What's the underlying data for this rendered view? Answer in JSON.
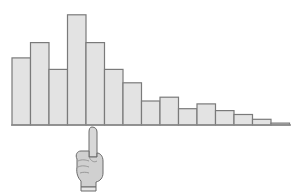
{
  "chart_data": {
    "type": "bar",
    "title": "",
    "xlabel": "",
    "ylabel": "",
    "categories": [
      "1",
      "2",
      "3",
      "4",
      "5",
      "6",
      "7",
      "8",
      "9",
      "10",
      "11",
      "12",
      "13",
      "14",
      "15"
    ],
    "values": [
      70,
      86,
      58,
      115,
      86,
      58,
      44,
      25,
      29,
      17,
      22,
      15,
      11,
      6,
      2
    ],
    "ylim": [
      0,
      120
    ],
    "grid": false,
    "legend": null,
    "bar_color": "#e3e3e3",
    "bar_edge_color": "#7a7a7a",
    "annotations": [
      {
        "type": "pointing-hand-icon",
        "position": "below x-axis, at boundary between bar 4 and bar 5"
      }
    ]
  }
}
